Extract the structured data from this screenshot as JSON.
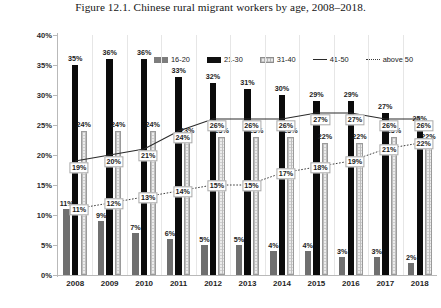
{
  "caption": "Figure 12.1. Chinese rural migrant workers by age, 2008–2018.",
  "legend": {
    "items": [
      {
        "label": "16-20",
        "key": "swatch-16-20",
        "color": "#7d7d7d"
      },
      {
        "label": "21-30",
        "key": "swatch-21-30",
        "color": "#101010"
      },
      {
        "label": "31-40",
        "key": "swatch-31-40",
        "color": "#e8e8e8"
      },
      {
        "label": "41-50",
        "key": "swatch-41-50",
        "color": "#2a2a2a"
      },
      {
        "label": "above 50",
        "key": "swatch-above-50",
        "color": "#3a3a3a"
      }
    ]
  },
  "axis": {
    "y_ticks": [
      "0%",
      "5%",
      "10%",
      "15%",
      "20%",
      "25%",
      "30%",
      "35%",
      "40%"
    ],
    "y_min": 0,
    "y_max": 40
  },
  "chart_data": {
    "type": "bar",
    "title": "Figure 12.1. Chinese rural migrant workers by age, 2008–2018.",
    "xlabel": "",
    "ylabel": "",
    "ylim": [
      0,
      40
    ],
    "grid": false,
    "legend_position": "top",
    "categories": [
      "2008",
      "2009",
      "2010",
      "2011",
      "2012",
      "2013",
      "2014",
      "2015",
      "2016",
      "2017",
      "2018"
    ],
    "series": [
      {
        "name": "16-20",
        "type": "bar",
        "values": [
          11,
          9,
          7,
          6,
          5,
          5,
          4,
          4,
          3,
          3,
          2
        ],
        "labels": [
          "11%",
          "9%",
          "7%",
          "6%",
          "5%",
          "5%",
          "4%",
          "4%",
          "3%",
          "3%",
          "2%"
        ]
      },
      {
        "name": "21-30",
        "type": "bar",
        "values": [
          35,
          36,
          36,
          33,
          32,
          31,
          30,
          29,
          29,
          27,
          25
        ],
        "labels": [
          "35%",
          "36%",
          "36%",
          "33%",
          "32%",
          "31%",
          "30%",
          "29%",
          "29%",
          "27%",
          "25%"
        ]
      },
      {
        "name": "31-40",
        "type": "bar",
        "values": [
          24,
          24,
          24,
          23,
          23,
          23,
          23,
          22,
          22,
          23,
          22
        ],
        "labels": [
          "24%",
          "24%",
          "24%",
          "23%",
          "23%",
          "23%",
          "23%",
          "22%",
          "22%",
          "23%",
          "22%"
        ]
      },
      {
        "name": "41-50",
        "type": "line",
        "values": [
          19,
          20,
          21,
          24,
          26,
          26,
          26,
          27,
          27,
          26,
          26
        ],
        "labels": [
          "19%",
          "20%",
          "21%",
          "24%",
          "26%",
          "26%",
          "26%",
          "27%",
          "27%",
          "26%",
          "26%"
        ]
      },
      {
        "name": "above 50",
        "type": "line",
        "values": [
          11,
          12,
          13,
          14,
          15,
          15,
          17,
          18,
          19,
          21,
          22
        ],
        "labels": [
          "11%",
          "12%",
          "13%",
          "14%",
          "15%",
          "15%",
          "17%",
          "18%",
          "19%",
          "21%",
          "22%"
        ]
      }
    ]
  }
}
